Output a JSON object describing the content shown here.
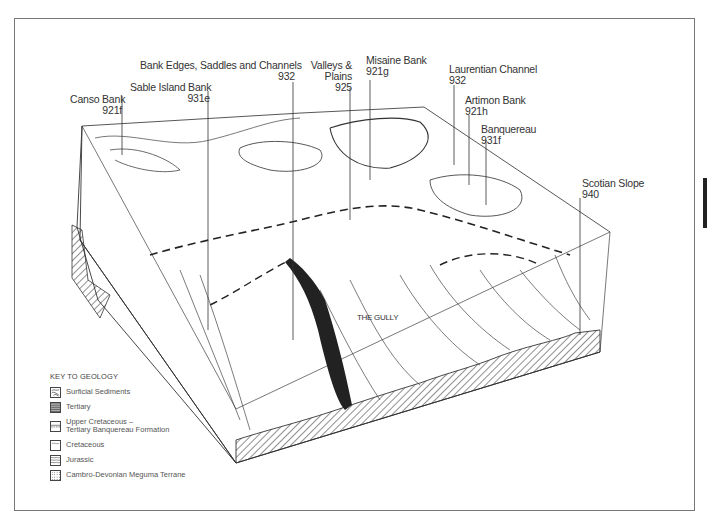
{
  "diagram": {
    "type": "3D block diagram of Scotian Shelf seafloor",
    "callouts": [
      {
        "name": "Canso Bank",
        "code": "921f"
      },
      {
        "name": "Sable Island Bank",
        "code": "931e"
      },
      {
        "name": "Bank Edges, Saddles and Channels",
        "code": "932"
      },
      {
        "name": "Valleys &",
        "name2": "Plains",
        "code": "925"
      },
      {
        "name": "Misaine Bank",
        "code": "921g"
      },
      {
        "name": "Laurentian Channel",
        "code": "932"
      },
      {
        "name": "Artimon Bank",
        "code": "921h"
      },
      {
        "name": "Banquereau",
        "code": "931f"
      },
      {
        "name": "Scotian Slope",
        "code": "940"
      }
    ],
    "feature_label": "THE GULLY"
  },
  "key": {
    "title": "KEY TO GEOLOGY",
    "items": [
      {
        "label": "Surficial Sediments",
        "pattern": "surficial"
      },
      {
        "label": "Tertiary",
        "pattern": "horizontal-lines"
      },
      {
        "label": "Upper Cretaceous –",
        "label2": "Tertiary Banquereau Formation",
        "pattern": "banded"
      },
      {
        "label": "Cretaceous",
        "pattern": "plain"
      },
      {
        "label": "Jurassic",
        "pattern": "wavy"
      },
      {
        "label": "Cambro-Devonian Meguma Terrane",
        "pattern": "crosshatch"
      }
    ]
  },
  "colors": {
    "line": "#333333",
    "frame": "#777777",
    "tab": "#222222"
  }
}
